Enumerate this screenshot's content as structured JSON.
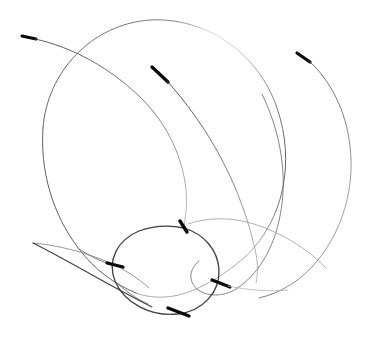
{
  "figure": {
    "kind": "line-drawing",
    "background_color": "#ffffff",
    "width": 371,
    "height": 350,
    "stroke_color_thin": "#4a4a4f",
    "stroke_color_thick": "#0a0a0a",
    "stroke_color_faint": "#8e8e95",
    "thin_width": 0.85,
    "thick_width": 3.4
  },
  "chart_data": {
    "type": "line",
    "xlabel": "",
    "ylabel": "",
    "xlim": [
      0,
      371
    ],
    "ylim": [
      0,
      350
    ],
    "grid": false,
    "legend": "none",
    "series": [
      {
        "name": "central-ellipse",
        "kind": "closed-ellipse",
        "center": [
          165,
          267
        ],
        "radius_x": 52,
        "radius_y": 42,
        "rotation_deg": -8
      },
      {
        "name": "outer-loop-large",
        "kind": "closed-loop",
        "extent": [
          [
            42,
            18
          ],
          [
            282,
            300
          ]
        ]
      },
      {
        "name": "right-sweep",
        "kind": "open-arc",
        "start": [
          297,
          53
        ],
        "end": [
          258,
          298
        ]
      },
      {
        "name": "upper-left-whisker",
        "kind": "open-arc",
        "start": [
          23,
          36
        ],
        "end": [
          185,
          226
        ]
      },
      {
        "name": "inner-diagonal-stroke",
        "kind": "open-arc",
        "start": [
          153,
          68
        ],
        "end": [
          255,
          268
        ]
      },
      {
        "name": "left-lens-sliver",
        "kind": "closed-sliver",
        "cusp": [
          33,
          243
        ],
        "end": [
          150,
          305
        ]
      }
    ],
    "thick_tips": [
      {
        "name": "tip-upper-left",
        "at": [
          23,
          36
        ],
        "angle_deg": 15
      },
      {
        "name": "tip-upper-middle",
        "at": [
          153,
          68
        ],
        "angle_deg": 45
      },
      {
        "name": "tip-upper-right",
        "at": [
          297,
          53
        ],
        "angle_deg": 35
      },
      {
        "name": "tip-ellipse-top",
        "at": [
          183,
          227
        ],
        "angle_deg": 70
      },
      {
        "name": "tip-ellipse-left",
        "at": [
          113,
          265
        ],
        "angle_deg": 10
      },
      {
        "name": "tip-ellipse-right",
        "at": [
          219,
          283
        ],
        "angle_deg": 12
      },
      {
        "name": "tip-ellipse-bottom",
        "at": [
          177,
          312
        ],
        "angle_deg": 18
      }
    ]
  }
}
